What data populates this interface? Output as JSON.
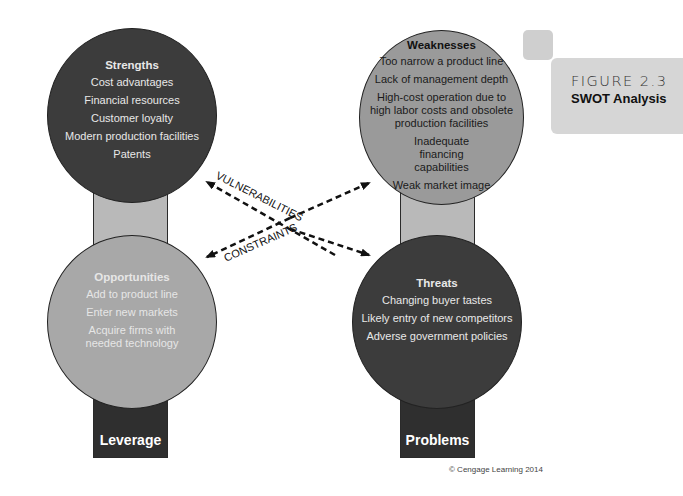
{
  "figure": {
    "number": "FIGURE 2.3",
    "title": "SWOT Analysis"
  },
  "strengths": {
    "title": "Strengths",
    "items": [
      "Cost advantages",
      "Financial resources",
      "Customer loyalty",
      "Modern production facilities",
      "Patents"
    ]
  },
  "weaknesses": {
    "title": "Weaknesses",
    "items": [
      "Too narrow a product line",
      "Lack of management depth",
      "High-cost operation due to high labor costs and obsolete production facilities",
      "Inadequate financing capabilities",
      "Weak market image"
    ]
  },
  "opportunities": {
    "title": "Opportunities",
    "items": [
      "Add to product line",
      "Enter new markets",
      "Acquire firms with needed technology"
    ]
  },
  "threats": {
    "title": "Threats",
    "items": [
      "Changing buyer tastes",
      "Likely entry of new competitors",
      "Adverse government policies"
    ]
  },
  "bases": {
    "left": "Leverage",
    "right": "Problems"
  },
  "arrows": {
    "vulnerabilities": "VULNERABILITIES",
    "constraints": "CONSTRAINTS"
  },
  "copyright": "© Cengage Learning 2014",
  "colors": {
    "dark_circle": "#3c3c3c",
    "mid_circle": "#9a9a9a",
    "light_bar": "#b9b9b9",
    "dark_bar": "#2f2f2f",
    "figure_box": "#d6d6d6"
  }
}
